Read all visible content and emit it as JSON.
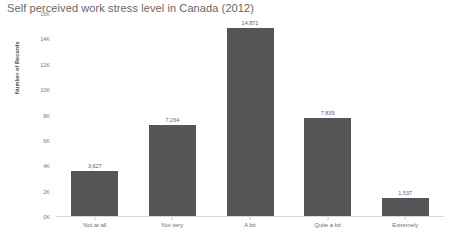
{
  "chart_data": {
    "type": "bar",
    "title": "Self perceived work stress level in Canada (2012)",
    "xlabel": "",
    "ylabel": "Number of Records",
    "categories": [
      "Not at all",
      "Not very",
      "A bit",
      "Quite a bit",
      "Extremely"
    ],
    "values": [
      3627,
      7264,
      14871,
      7839,
      1537
    ],
    "value_labels": [
      "3,627",
      "7,264",
      "14,871",
      "7,839",
      "1,537"
    ],
    "ylim": [
      0,
      16000
    ],
    "y_ticks": [
      16000,
      14000,
      12000,
      10000,
      8000,
      6000,
      4000,
      2000,
      0
    ],
    "y_tick_labels": [
      "16K",
      "14K",
      "12K",
      "10K",
      "8K",
      "6K",
      "4K",
      "2K",
      "0K"
    ],
    "grid": false,
    "legend": null,
    "bar_color": "#555557",
    "background_color": "#ffffff",
    "title_color": "#666666",
    "axis_text_color": "#6b6b6b"
  }
}
